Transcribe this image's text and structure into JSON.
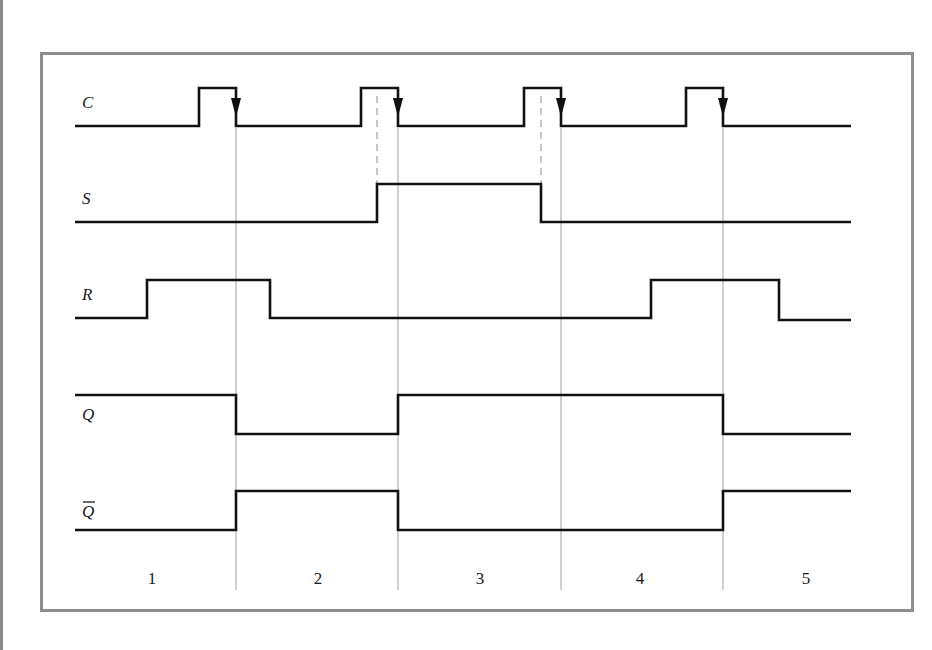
{
  "diagram": {
    "type": "timing-diagram",
    "signals": [
      {
        "name": "C",
        "label": "C",
        "overline": false,
        "low_y": 126,
        "high_y": 88,
        "points": [
          [
            75,
            126
          ],
          [
            199,
            126
          ],
          [
            199,
            88
          ],
          [
            236,
            88
          ],
          [
            236,
            126
          ],
          [
            361,
            126
          ],
          [
            361,
            88
          ],
          [
            398,
            88
          ],
          [
            398,
            126
          ],
          [
            524,
            126
          ],
          [
            524,
            88
          ],
          [
            561,
            88
          ],
          [
            561,
            126
          ],
          [
            686,
            126
          ],
          [
            686,
            88
          ],
          [
            723,
            88
          ],
          [
            723,
            126
          ],
          [
            851,
            126
          ]
        ]
      },
      {
        "name": "S",
        "label": "S",
        "overline": false,
        "low_y": 222,
        "high_y": 184,
        "points": [
          [
            75,
            222
          ],
          [
            377,
            222
          ],
          [
            377,
            184
          ],
          [
            541,
            184
          ],
          [
            541,
            222
          ],
          [
            851,
            222
          ]
        ]
      },
      {
        "name": "R",
        "label": "R",
        "overline": false,
        "low_y": 318,
        "high_y": 280,
        "points": [
          [
            75,
            318
          ],
          [
            147,
            318
          ],
          [
            147,
            280
          ],
          [
            270,
            280
          ],
          [
            270,
            318
          ],
          [
            651,
            318
          ],
          [
            651,
            280
          ],
          [
            779,
            280
          ],
          [
            779,
            320
          ],
          [
            851,
            320
          ]
        ]
      },
      {
        "name": "Q",
        "label": "Q",
        "overline": false,
        "low_y": 434,
        "high_y": 395,
        "points": [
          [
            75,
            395
          ],
          [
            236,
            395
          ],
          [
            236,
            434
          ],
          [
            398,
            434
          ],
          [
            398,
            395
          ],
          [
            723,
            395
          ],
          [
            723,
            434
          ],
          [
            851,
            434
          ]
        ]
      },
      {
        "name": "Q-bar",
        "label": "Q",
        "overline": true,
        "low_y": 530,
        "high_y": 491,
        "points": [
          [
            75,
            530
          ],
          [
            236,
            530
          ],
          [
            236,
            491
          ],
          [
            398,
            491
          ],
          [
            398,
            530
          ],
          [
            723,
            530
          ],
          [
            723,
            491
          ],
          [
            851,
            491
          ]
        ]
      }
    ],
    "label_positions": [
      {
        "x": 82,
        "y": 108
      },
      {
        "x": 82,
        "y": 204
      },
      {
        "x": 82,
        "y": 300
      },
      {
        "x": 82,
        "y": 420
      },
      {
        "x": 82,
        "y": 517
      }
    ],
    "falling_edge_markers_x": [
      236,
      398,
      561,
      723
    ],
    "dashed_guides": [
      {
        "x": 377,
        "y1": 96,
        "y2": 184
      },
      {
        "x": 541,
        "y1": 96,
        "y2": 184
      }
    ],
    "period_dividers_x": [
      236,
      398,
      561,
      723
    ],
    "period_divider_range": [
      128,
      590
    ],
    "periods": [
      {
        "label": "1",
        "x": 152
      },
      {
        "label": "2",
        "x": 318
      },
      {
        "label": "3",
        "x": 480
      },
      {
        "label": "4",
        "x": 640
      },
      {
        "label": "5",
        "x": 806
      }
    ],
    "period_label_y": 584,
    "colors": {
      "signal": "#111111",
      "guide": "#a0a0a0",
      "dashed": "#8c8c8c",
      "frame": "#8e8e8e"
    }
  }
}
